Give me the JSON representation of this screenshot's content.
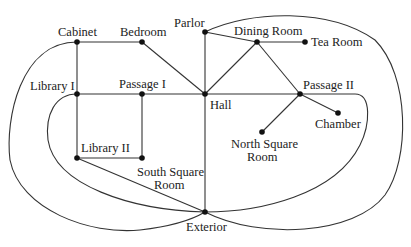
{
  "diagram": {
    "type": "graph",
    "colors": {
      "edge": "#333333",
      "node": "#111111",
      "label": "#222222",
      "background": "#ffffff"
    },
    "nodes": [
      {
        "id": "cabinet",
        "label": "Cabinet",
        "x": 77,
        "y": 42,
        "lx": 58,
        "ly": 36
      },
      {
        "id": "bedroom",
        "label": "Bedroom",
        "x": 142,
        "y": 42,
        "lx": 120,
        "ly": 36
      },
      {
        "id": "parlor",
        "label": "Parlor",
        "x": 205,
        "y": 32,
        "lx": 174,
        "ly": 27
      },
      {
        "id": "dining_room",
        "label": "Dining Room",
        "x": 257,
        "y": 42,
        "lx": 234,
        "ly": 35
      },
      {
        "id": "tea_room",
        "label": "Tea Room",
        "x": 305,
        "y": 42,
        "lx": 311,
        "ly": 46
      },
      {
        "id": "library_i",
        "label": "Library I",
        "x": 77,
        "y": 94,
        "lx": 30,
        "ly": 90
      },
      {
        "id": "passage_i",
        "label": "Passage I",
        "x": 142,
        "y": 94,
        "lx": 119,
        "ly": 88
      },
      {
        "id": "hall",
        "label": "Hall",
        "x": 205,
        "y": 94,
        "lx": 210,
        "ly": 109
      },
      {
        "id": "passage_ii",
        "label": "Passage II",
        "x": 300,
        "y": 94,
        "lx": 303,
        "ly": 89
      },
      {
        "id": "chamber",
        "label": "Chamber",
        "x": 338,
        "y": 113,
        "lx": 315,
        "ly": 128
      },
      {
        "id": "north_square_room",
        "label": "North Square",
        "label2": "Room",
        "x": 262,
        "y": 132,
        "lx": 231,
        "ly": 148,
        "lx2": 247,
        "ly2": 161
      },
      {
        "id": "library_ii",
        "label": "Library II",
        "x": 77,
        "y": 158,
        "lx": 81,
        "ly": 152
      },
      {
        "id": "south_square_room",
        "label": "South Square",
        "label2": "Room",
        "x": 142,
        "y": 158,
        "lx": 137,
        "ly": 176,
        "lx2": 154,
        "ly2": 189
      },
      {
        "id": "exterior",
        "label": "Exterior",
        "x": 205,
        "y": 212,
        "lx": 186,
        "ly": 231
      }
    ],
    "edges": [
      {
        "from": "cabinet",
        "to": "bedroom"
      },
      {
        "from": "bedroom",
        "to": "hall"
      },
      {
        "from": "cabinet",
        "to": "library_i"
      },
      {
        "from": "library_i",
        "to": "library_ii"
      },
      {
        "from": "library_i",
        "to": "passage_i"
      },
      {
        "from": "passage_i",
        "to": "hall"
      },
      {
        "from": "passage_i",
        "to": "south_square_room"
      },
      {
        "from": "library_ii",
        "to": "south_square_room"
      },
      {
        "from": "library_ii",
        "to": "exterior"
      },
      {
        "from": "parlor",
        "to": "hall"
      },
      {
        "from": "parlor",
        "to": "dining_room"
      },
      {
        "from": "dining_room",
        "to": "tea_room"
      },
      {
        "from": "dining_room",
        "to": "hall"
      },
      {
        "from": "dining_room",
        "to": "passage_ii"
      },
      {
        "from": "hall",
        "to": "passage_ii"
      },
      {
        "from": "hall",
        "to": "exterior"
      },
      {
        "from": "passage_ii",
        "to": "chamber"
      },
      {
        "from": "passage_ii",
        "to": "north_square_room"
      },
      {
        "from": "cabinet",
        "to": "exterior",
        "curved": true
      },
      {
        "from": "library_i",
        "to": "exterior",
        "curved": true
      },
      {
        "from": "parlor",
        "to": "exterior",
        "curved": true
      },
      {
        "from": "passage_ii",
        "to": "exterior",
        "curved": true
      }
    ]
  }
}
